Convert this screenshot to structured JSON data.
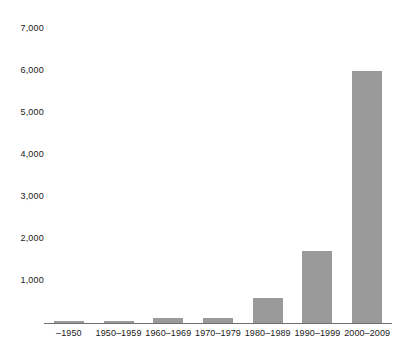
{
  "chart_data": {
    "type": "bar",
    "title": "",
    "subtitle": "",
    "xlabel": "",
    "ylabel": "",
    "categories": [
      "–1950",
      "1950–1959",
      "1960–1969",
      "1970–1979",
      "1980–1989",
      "1990–1999",
      "2000–2009"
    ],
    "values": [
      60,
      70,
      150,
      140,
      600,
      1700,
      5900
    ],
    "ylim": [
      0,
      7000
    ],
    "y_ticks": [
      1000,
      2000,
      3000,
      4000,
      5000,
      6000,
      7000
    ],
    "y_tick_labels": [
      "1,000",
      "2,000",
      "3,000",
      "4,000",
      "5,000",
      "6,000",
      "7,000"
    ],
    "grid": false,
    "legend": null,
    "bar_color": "#9a9a9a",
    "axis_color": "#6f6f6f",
    "text_color": "#1a1a1a"
  }
}
